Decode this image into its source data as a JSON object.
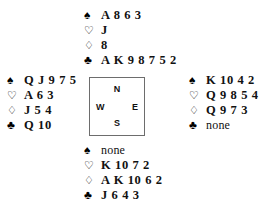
{
  "diagram": {
    "title": "Bridge deal diagram",
    "suit_symbols": {
      "spade": "♠",
      "heart": "♡",
      "diamond": "♢",
      "club": "♣"
    },
    "void_label": "none",
    "colors": {
      "ink": "#111111",
      "box_border": "#6d6d6d",
      "background": "#ffffff"
    }
  },
  "compass": {
    "north": "N",
    "south": "S",
    "west": "W",
    "east": "E"
  },
  "hands": {
    "north": {
      "position": "North",
      "spades": "A 8 6 3",
      "hearts": "J",
      "diamonds": "8",
      "clubs": "A K 9 8 7 5 2"
    },
    "west": {
      "position": "West",
      "spades": "Q J 9 7 5",
      "hearts": "A 6 3",
      "diamonds": "J 5 4",
      "clubs": "Q 10"
    },
    "east": {
      "position": "East",
      "spades": "K 10 4 2",
      "hearts": "Q 9 8 5 4",
      "diamonds": "Q 9 7 3",
      "clubs": "none"
    },
    "south": {
      "position": "South",
      "spades": "none",
      "hearts": "K 10 7 2",
      "diamonds": "A K 10 6 2",
      "clubs": "J 6 4 3"
    }
  }
}
